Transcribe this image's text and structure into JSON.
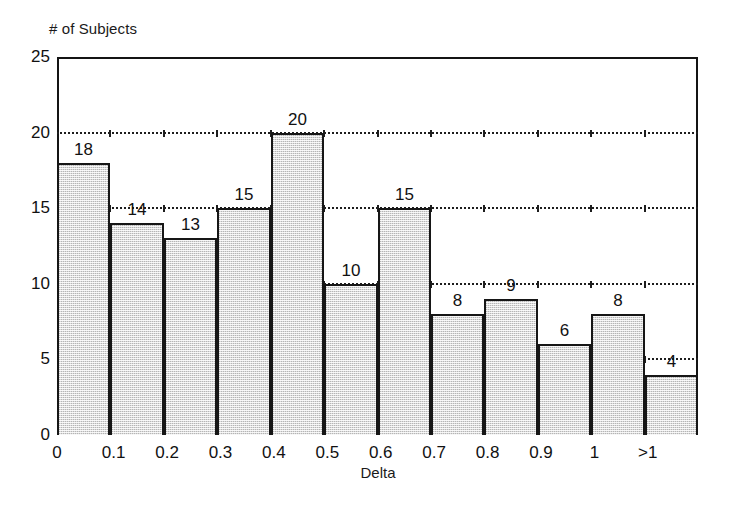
{
  "chart_data": {
    "type": "bar",
    "title": "",
    "xlabel": "Delta",
    "ylabel": "# of Subjects",
    "categories": [
      "0",
      "0.1",
      "0.2",
      "0.3",
      "0.4",
      "0.5",
      "0.6",
      "0.7",
      "0.8",
      "0.9",
      "1",
      ">1"
    ],
    "values": [
      18,
      14,
      13,
      15,
      20,
      10,
      15,
      8,
      9,
      6,
      8,
      4
    ],
    "bar_labels": [
      "18",
      "14",
      "13",
      "15",
      "20",
      "10",
      "15",
      "8",
      "9",
      "6",
      "8",
      "4"
    ],
    "xlim": [
      0,
      12
    ],
    "ylim": [
      0,
      25
    ],
    "yticks": [
      0,
      5,
      10,
      15,
      20,
      25
    ],
    "ytick_labels": [
      "0",
      "5",
      "10",
      "15",
      "20",
      "25"
    ],
    "gridlines": [
      5,
      10,
      15,
      20
    ],
    "grid": "horizontal-dotted",
    "legend": "none",
    "xtick_position": "bar-edges",
    "colors": {
      "bar_fill": "#dcdcdc",
      "bar_edge": "#161616",
      "axis": "#141414",
      "grid": "#1d1d1d",
      "text": "#111111",
      "background": "#ffffff"
    }
  },
  "axes": {
    "y_title": "# of Subjects",
    "x_title": "Delta"
  }
}
